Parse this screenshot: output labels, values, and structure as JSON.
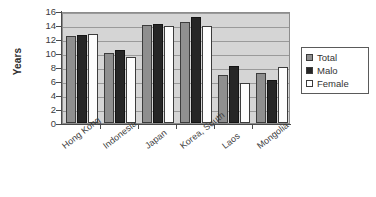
{
  "chart_data": {
    "type": "bar",
    "title": "",
    "xlabel": "",
    "ylabel": "Years",
    "ylim": [
      0,
      16
    ],
    "ytick_step": 2,
    "yticks": [
      16,
      14,
      12,
      10,
      8,
      6,
      4,
      2,
      0
    ],
    "grid": true,
    "legend_position": "right",
    "categories": [
      "Hong Kong",
      "Indonesia",
      "Japan",
      "Korea, South",
      "Laos",
      "Mongolia"
    ],
    "series": [
      {
        "name": "Total",
        "color": "#8f8f8f",
        "values": [
          12.5,
          10.0,
          14.0,
          14.5,
          6.9,
          7.2
        ]
      },
      {
        "name": "Malo",
        "color": "#262626",
        "values": [
          12.6,
          10.4,
          14.2,
          15.1,
          8.2,
          6.2
        ]
      },
      {
        "name": "Female",
        "color": "#ffffff",
        "values": [
          12.7,
          9.5,
          13.8,
          13.9,
          5.7,
          8.0
        ]
      }
    ]
  },
  "legend": {
    "items": [
      {
        "label": "Total"
      },
      {
        "label": "Malo"
      },
      {
        "label": "Female"
      }
    ]
  }
}
